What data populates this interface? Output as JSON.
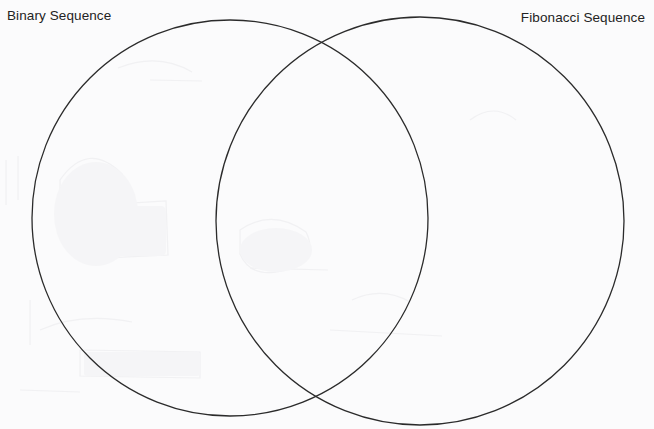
{
  "diagram": {
    "type": "venn",
    "title": "",
    "background_color": "#fbfbfc",
    "stroke_color": "#2b2b2b",
    "stroke_width": 1.3,
    "text_color": "#232323",
    "sets": [
      {
        "id": "left",
        "label": "Binary Sequence",
        "label_position": "top-left",
        "center_x": 230,
        "center_y": 218,
        "radius": 198
      },
      {
        "id": "right",
        "label": "Fibonacci Sequence",
        "label_position": "top-right",
        "center_x": 420,
        "center_y": 221,
        "radius": 204
      }
    ],
    "regions": {
      "left_only_items": [],
      "right_only_items": [],
      "intersection_items": []
    }
  }
}
